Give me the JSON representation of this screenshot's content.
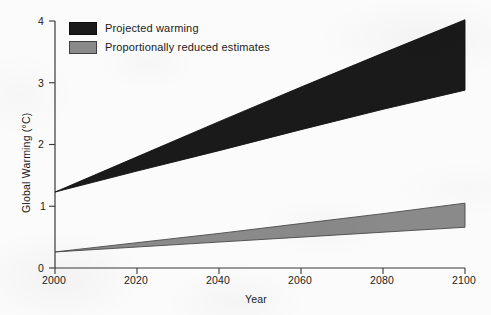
{
  "chart_data": {
    "type": "area",
    "title": "",
    "xlabel": "Year",
    "ylabel": "Global Warming (°C)",
    "xlim": [
      2000,
      2100
    ],
    "ylim": [
      0,
      4
    ],
    "xticks": [
      "2000",
      "2020",
      "2040",
      "2060",
      "2080",
      "2100"
    ],
    "xtick_values": [
      2000,
      2020,
      2040,
      2060,
      2080,
      2100
    ],
    "yticks": [
      "0",
      "1",
      "2",
      "3",
      "4"
    ],
    "ytick_values": [
      0,
      1,
      2,
      3,
      4
    ],
    "grid": false,
    "legend_position": "upper left",
    "x": [
      2000,
      2020,
      2040,
      2060,
      2080,
      2100
    ],
    "bands": [
      {
        "name": "Projected warming",
        "color": "#1a1a1a",
        "edge_color": "#111111",
        "upper": [
          1.23,
          1.8,
          2.37,
          2.93,
          3.48,
          4.02
        ],
        "lower": [
          1.23,
          1.57,
          1.9,
          2.24,
          2.57,
          2.88
        ]
      },
      {
        "name": "Proportionally reduced estimates",
        "color": "#8a8a8a",
        "edge_color": "#4a4a4a",
        "upper": [
          0.26,
          0.41,
          0.56,
          0.72,
          0.88,
          1.05
        ],
        "lower": [
          0.26,
          0.34,
          0.42,
          0.5,
          0.58,
          0.66
        ]
      }
    ]
  },
  "legend": {
    "items": [
      {
        "label": "Projected warming",
        "swatch_color": "#1a1a1a",
        "swatch_border": "#0d0d0d"
      },
      {
        "label": "Proportionally reduced estimates",
        "swatch_color": "#8a8a8a",
        "swatch_border": "#3f3f3f"
      }
    ]
  },
  "axes": {
    "y_title": "Global Warming (°C)",
    "x_title": "Year",
    "y_tick_0": "0",
    "y_tick_1": "1",
    "y_tick_2": "2",
    "y_tick_3": "3",
    "y_tick_4": "4",
    "x_tick_2000": "2000",
    "x_tick_2020": "2020",
    "x_tick_2040": "2040",
    "x_tick_2060": "2060",
    "x_tick_2080": "2080",
    "x_tick_2100": "2100"
  },
  "colors": {
    "background": "#fbfbfb",
    "axis": "#3a3a3a",
    "text": "#1a1a1a",
    "band_dark": "#1a1a1a",
    "band_gray": "#8a8a8a"
  }
}
